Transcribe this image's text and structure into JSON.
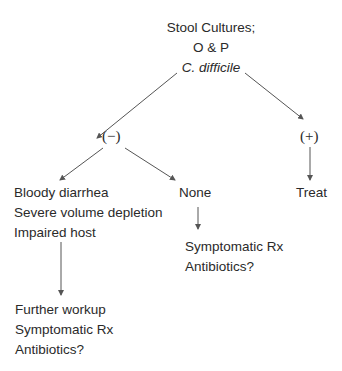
{
  "diagram": {
    "root": {
      "lines": [
        "Stool Cultures;",
        "O & P",
        "C. difficile"
      ]
    },
    "negative": {
      "label": "(−)"
    },
    "positive": {
      "label": "(+)"
    },
    "treat": {
      "label": "Treat"
    },
    "bloody": {
      "lines": [
        "Bloody diarrhea",
        "Severe volume depletion",
        "Impaired host"
      ]
    },
    "none": {
      "label": "None"
    },
    "none_result": {
      "lines": [
        "Symptomatic Rx",
        "Antibiotics?"
      ]
    },
    "further": {
      "lines": [
        "Further workup",
        "Symptomatic Rx",
        "Antibiotics?"
      ]
    }
  },
  "colors": {
    "line": "#555555",
    "text": "#2a2a2a"
  }
}
